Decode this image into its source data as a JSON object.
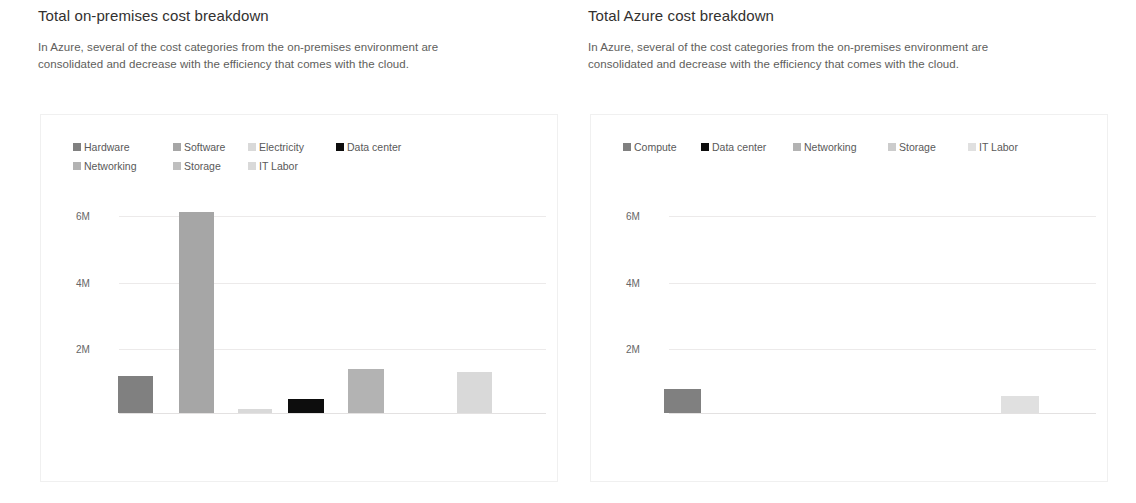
{
  "panels": [
    {
      "title": "Total on-premises cost breakdown",
      "subtitle": "In Azure, several of the cost categories from the on-premises environment are consolidated and decrease with the efficiency that comes with the cloud."
    },
    {
      "title": "Total Azure cost breakdown",
      "subtitle": "In Azure, several of the cost categories from the on-premises environment are consolidated and decrease with the efficiency that comes with the cloud."
    }
  ],
  "chart_data": [
    {
      "type": "bar",
      "title": "Total on-premises cost breakdown",
      "xlabel": "",
      "ylabel": "",
      "ylim": [
        0,
        7000000
      ],
      "yticks": [
        2000000,
        4000000,
        6000000
      ],
      "ytick_labels": [
        "2M",
        "4M",
        "6M"
      ],
      "grid": true,
      "legend_position": "top-left",
      "categories": [
        "Hardware",
        "Software",
        "Electricity",
        "Data center",
        "Networking",
        "Storage",
        "IT Labor"
      ],
      "values": [
        1120000,
        6090000,
        110000,
        420000,
        1340000,
        0,
        1240000
      ],
      "colors": [
        "#808080",
        "#a6a6a6",
        "#d9d9d9",
        "#0d0d0d",
        "#b3b3b3",
        "#bfbfbf",
        "#d9d9d9"
      ],
      "series": [
        {
          "name": "Hardware",
          "value": 1120000,
          "color": "#808080"
        },
        {
          "name": "Software",
          "value": 6090000,
          "color": "#a6a6a6"
        },
        {
          "name": "Electricity",
          "value": 110000,
          "color": "#d9d9d9"
        },
        {
          "name": "Data center",
          "value": 420000,
          "color": "#0d0d0d"
        },
        {
          "name": "Networking",
          "value": 1340000,
          "color": "#b3b3b3"
        },
        {
          "name": "Storage",
          "value": 0,
          "color": "#bfbfbf"
        },
        {
          "name": "IT Labor",
          "value": 1240000,
          "color": "#d9d9d9"
        }
      ]
    },
    {
      "type": "bar",
      "title": "Total Azure cost breakdown",
      "xlabel": "",
      "ylabel": "",
      "ylim": [
        0,
        7000000
      ],
      "yticks": [
        2000000,
        4000000,
        6000000
      ],
      "ytick_labels": [
        "2M",
        "4M",
        "6M"
      ],
      "grid": true,
      "legend_position": "top-left",
      "categories": [
        "Compute",
        "Data center",
        "Networking",
        "Storage",
        "IT Labor"
      ],
      "values": [
        740000,
        0,
        0,
        0,
        510000
      ],
      "colors": [
        "#808080",
        "#0d0d0d",
        "#b3b3b3",
        "#cccccc",
        "#e0e0e0"
      ],
      "series": [
        {
          "name": "Compute",
          "value": 740000,
          "color": "#808080"
        },
        {
          "name": "Data center",
          "value": 0,
          "color": "#0d0d0d"
        },
        {
          "name": "Networking",
          "value": 0,
          "color": "#b3b3b3"
        },
        {
          "name": "Storage",
          "value": 0,
          "color": "#cccccc"
        },
        {
          "name": "IT Labor",
          "value": 510000,
          "color": "#e0e0e0"
        }
      ]
    }
  ],
  "layout": {
    "left_legend_columns": [
      100,
      75,
      88,
      120
    ],
    "right_legend_columns": [
      78,
      92,
      95,
      80
    ],
    "plot": {
      "baseline_y": 298,
      "tick_y": {
        "6M": 101,
        "4M": 168,
        "2M": 234
      },
      "grid_left": 78,
      "grid_right": 505,
      "tick_label_left": 35
    },
    "left_bars": [
      {
        "name": "Hardware",
        "x": 77,
        "w": 35,
        "h": 37
      },
      {
        "name": "Software",
        "x": 138,
        "w": 35,
        "h": 201
      },
      {
        "name": "Electricity",
        "x": 197,
        "w": 34,
        "h": 4
      },
      {
        "name": "Data center",
        "x": 247,
        "w": 36,
        "h": 14
      },
      {
        "name": "Networking",
        "x": 307,
        "w": 36,
        "h": 44
      },
      {
        "name": "IT Labor",
        "x": 416,
        "w": 35,
        "h": 41
      }
    ],
    "right_bars": [
      {
        "name": "Compute",
        "x": 73,
        "w": 37,
        "h": 24
      },
      {
        "name": "IT Labor",
        "x": 410,
        "w": 38,
        "h": 17
      }
    ]
  }
}
